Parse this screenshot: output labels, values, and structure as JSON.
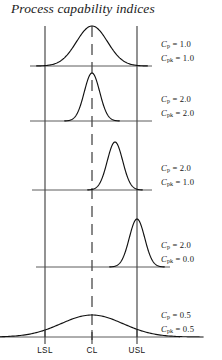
{
  "title": "Process capability indices",
  "chart_data": {
    "type": "line",
    "title": "Process capability indices",
    "xlabel": "",
    "ylabel": "",
    "grid": false,
    "legend_position": "right",
    "xlim": [
      0,
      180
    ],
    "spec_limits": {
      "LSL": {
        "label": "LSL",
        "x": 45
      },
      "CL": {
        "label": "CL",
        "x": 92,
        "style": "dashed"
      },
      "USL": {
        "label": "USL",
        "x": 137
      }
    },
    "axis_tick_labels": [
      "LSL",
      "CL",
      "USL"
    ],
    "panels": [
      {
        "index": 1,
        "cp": "1.0",
        "cpk": "1.0",
        "cp_label": "Cp = 1.0",
        "cpk_label": "Cpk = 1.0",
        "distribution": {
          "mean": 92,
          "sigma": 15.5,
          "peak_height": 40,
          "baseline_y": 66
        }
      },
      {
        "index": 2,
        "cp": "2.0",
        "cpk": "2.0",
        "cp_label": "Cp = 2.0",
        "cpk_label": "Cpk = 2.0",
        "distribution": {
          "mean": 92,
          "sigma": 7.7,
          "peak_height": 48,
          "baseline_y": 121
        }
      },
      {
        "index": 3,
        "cp": "2.0",
        "cpk": "1.0",
        "cp_label": "Cp = 2.0",
        "cpk_label": "Cpk = 1.0",
        "distribution": {
          "mean": 115,
          "sigma": 7.7,
          "peak_height": 48,
          "baseline_y": 190
        }
      },
      {
        "index": 4,
        "cp": "2.0",
        "cpk": "0.0",
        "cp_label": "Cp = 2.0",
        "cpk_label": "Cpk = 0.0",
        "distribution": {
          "mean": 137,
          "sigma": 7.7,
          "peak_height": 48,
          "baseline_y": 267
        }
      },
      {
        "index": 5,
        "cp": "0.5",
        "cpk": "0.5",
        "cp_label": "Cp = 0.5",
        "cpk_label": "Cpk = 0.5",
        "distribution": {
          "mean": 92,
          "sigma": 31,
          "peak_height": 22,
          "baseline_y": 337
        }
      }
    ]
  },
  "labels": {
    "cp_symbol": "C",
    "cp_sub": "p",
    "cpk_sub": "pk",
    "panel1": {
      "cp_value": " = 1.0",
      "cpk_value": " = 1.0"
    },
    "panel2": {
      "cp_value": " = 2.0",
      "cpk_value": " = 2.0"
    },
    "panel3": {
      "cp_value": " = 2.0",
      "cpk_value": " = 1.0"
    },
    "panel4": {
      "cp_value": " = 2.0",
      "cpk_value": " = 0.0"
    },
    "panel5": {
      "cp_value": " = 0.5",
      "cpk_value": " = 0.5"
    }
  },
  "axis": {
    "lsl": "LSL",
    "cl": "CL",
    "usl": "USL"
  },
  "colors": {
    "curve": "#111111",
    "baseline": "#4a4a4a",
    "spec_line": "#3a3a3a",
    "text": "#161616",
    "background": "#ffffff"
  }
}
